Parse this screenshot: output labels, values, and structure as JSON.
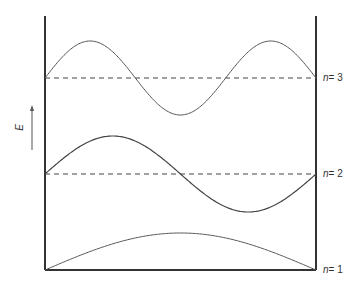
{
  "diagram": {
    "axis_label": "E",
    "levels": [
      {
        "n_label": "n",
        "value_label": "= 3",
        "baseline_y": 78,
        "amplitude": 37,
        "half_waves": 3
      },
      {
        "n_label": "n",
        "value_label": "= 2",
        "baseline_y": 174,
        "amplitude": 38,
        "half_waves": 2
      },
      {
        "n_label": "n",
        "value_label": "= 1",
        "baseline_y": 270,
        "amplitude": 37,
        "half_waves": 1
      }
    ],
    "colors": {
      "wall": "#333333",
      "wave": "#555555",
      "dashed": "#444444"
    }
  }
}
